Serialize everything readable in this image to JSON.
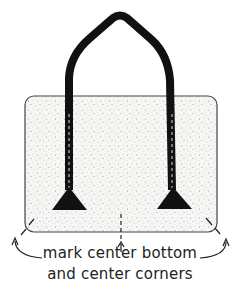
{
  "diagram": {
    "caption": {
      "line1": "mark center bottom",
      "line2": "and center corners"
    },
    "colors": {
      "outline": "#333333",
      "strap": "#111111",
      "fill": "#f4f4f2",
      "stipple": "#555555"
    }
  }
}
